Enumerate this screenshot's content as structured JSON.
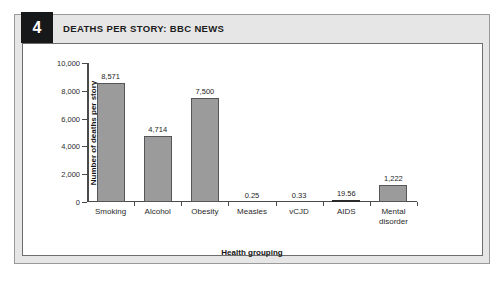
{
  "figure": {
    "number": "4",
    "title": "DEATHS PER STORY: BBC NEWS"
  },
  "chart_data": {
    "type": "bar",
    "title": "DEATHS PER STORY: BBC NEWS",
    "xlabel": "Health grouping",
    "ylabel": "Number of deaths per story",
    "ylim": [
      0,
      10000
    ],
    "yticks": [
      "0",
      "2,000",
      "4,000",
      "6,000",
      "8,000",
      "10,000"
    ],
    "ytick_values": [
      0,
      2000,
      4000,
      6000,
      8000,
      10000
    ],
    "grid": false,
    "legend": "none",
    "categories": [
      "Smoking",
      "Alcohol",
      "Obesity",
      "Measles",
      "vCJD",
      "AIDS",
      "Mental\ndisorder"
    ],
    "values": [
      8571,
      4714,
      7500,
      0.25,
      0.33,
      19.56,
      1222
    ],
    "value_labels": [
      "8,571",
      "4,714",
      "7,500",
      "0.25",
      "0.33",
      "19.56",
      "1,222"
    ],
    "bar_color": "#9b9b9b",
    "bar_edge_color": "#55565a"
  }
}
